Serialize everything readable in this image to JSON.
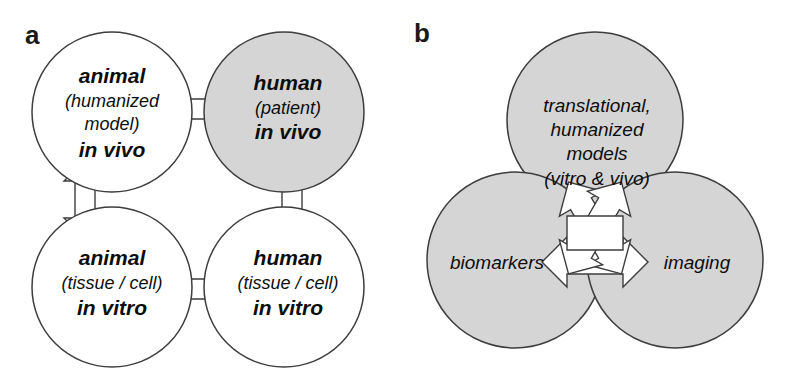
{
  "figure": {
    "type": "diagram",
    "background_color": "#ffffff",
    "stroke_color": "#3d3d3d",
    "text_color": "#0d0d0d",
    "circle_fill_white": "#ffffff",
    "circle_fill_gray": "#d5d5d5",
    "arrow_fill": "#ffffff"
  },
  "panels": [
    {
      "label": "a",
      "name": "panel-a",
      "layout": "2x2 grid of circles connected by bidirectional block arrows",
      "nodes": [
        {
          "id": "animal-in-vivo",
          "position": "top-left",
          "shaded": false,
          "lines": [
            {
              "text": "animal",
              "style": "bold-italic"
            },
            {
              "text": "(humanized",
              "style": "italic"
            },
            {
              "text": "model)",
              "style": "italic"
            },
            {
              "text": "in vivo",
              "style": "bold-italic"
            }
          ]
        },
        {
          "id": "human-in-vivo",
          "position": "top-right",
          "shaded": true,
          "lines": [
            {
              "text": "human",
              "style": "bold-italic"
            },
            {
              "text": "(patient)",
              "style": "italic"
            },
            {
              "text": "in vivo",
              "style": "bold-italic"
            }
          ]
        },
        {
          "id": "animal-in-vitro",
          "position": "bottom-left",
          "shaded": false,
          "lines": [
            {
              "text": "animal",
              "style": "bold-italic"
            },
            {
              "text": "(tissue / cell)",
              "style": "italic"
            },
            {
              "text": "in vitro",
              "style": "bold-italic"
            }
          ]
        },
        {
          "id": "human-in-vitro",
          "position": "bottom-right",
          "shaded": false,
          "lines": [
            {
              "text": "human",
              "style": "bold-italic"
            },
            {
              "text": "(tissue / cell)",
              "style": "italic"
            },
            {
              "text": "in vitro",
              "style": "bold-italic"
            }
          ]
        }
      ],
      "connectors": [
        {
          "id": "arrow-a-top-horizontal",
          "from": "animal-in-vivo",
          "to": "human-in-vivo",
          "direction": "bidirectional",
          "orientation": "horizontal"
        },
        {
          "id": "arrow-a-left-vertical",
          "from": "animal-in-vivo",
          "to": "animal-in-vitro",
          "direction": "bidirectional",
          "orientation": "vertical"
        },
        {
          "id": "arrow-a-right-vertical",
          "from": "human-in-vivo",
          "to": "human-in-vitro",
          "direction": "bidirectional",
          "orientation": "vertical"
        },
        {
          "id": "arrow-a-bottom-horizontal",
          "from": "animal-in-vitro",
          "to": "human-in-vitro",
          "direction": "bidirectional",
          "orientation": "horizontal"
        }
      ]
    },
    {
      "label": "b",
      "name": "panel-b",
      "layout": "three circles in triangular arrangement joined by three bidirectional block arrows meeting at a central hub",
      "nodes": [
        {
          "id": "translational-models",
          "position": "top",
          "shaded": true,
          "lines": [
            {
              "text": "translational,",
              "style": "italic"
            },
            {
              "text": "humanized",
              "style": "italic"
            },
            {
              "text": "models",
              "style": "italic"
            },
            {
              "text": "(vitro & vivo)",
              "style": "italic"
            }
          ]
        },
        {
          "id": "biomarkers",
          "position": "bottom-left",
          "shaded": true,
          "lines": [
            {
              "text": "biomarkers",
              "style": "italic"
            }
          ]
        },
        {
          "id": "imaging",
          "position": "bottom-right",
          "shaded": true,
          "lines": [
            {
              "text": "imaging",
              "style": "italic"
            }
          ]
        }
      ],
      "connectors": [
        {
          "id": "arrow-b-upper-left",
          "from": "biomarkers",
          "to": "translational-models",
          "direction": "bidirectional",
          "orientation": "diagonal-up-right"
        },
        {
          "id": "arrow-b-upper-right",
          "from": "imaging",
          "to": "translational-models",
          "direction": "bidirectional",
          "orientation": "diagonal-up-left"
        },
        {
          "id": "arrow-b-bottom",
          "from": "biomarkers",
          "to": "imaging",
          "direction": "bidirectional",
          "orientation": "horizontal"
        }
      ]
    }
  ]
}
